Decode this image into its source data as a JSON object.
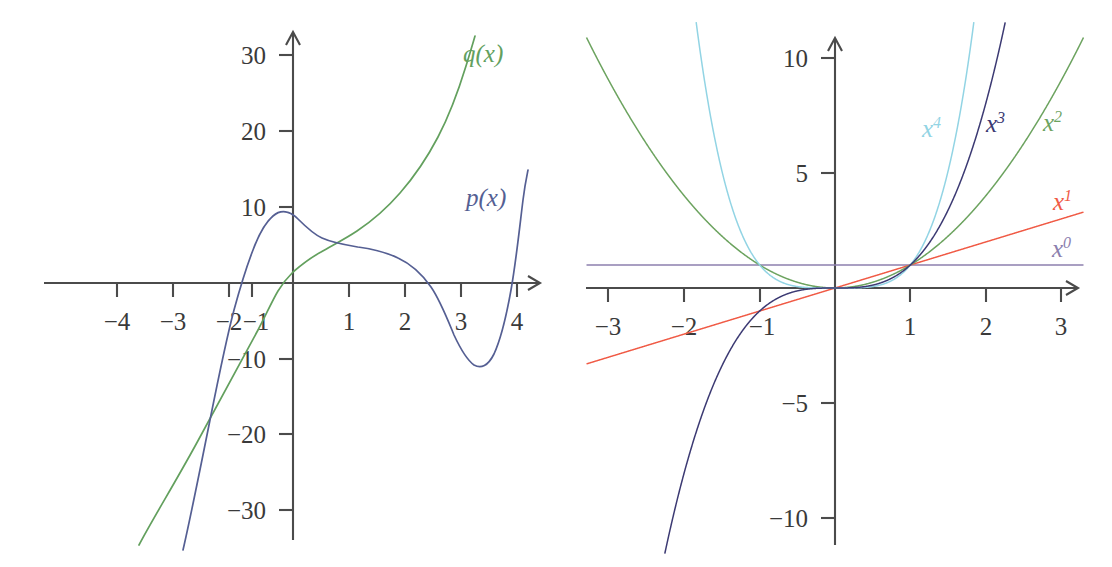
{
  "figures": [
    {
      "name": "left-plot",
      "axes": {
        "x_ticks": [
          "−4",
          "−3",
          "−2",
          "−1",
          "1",
          "2",
          "3",
          "4"
        ],
        "x_tick_values": [
          -4,
          -3,
          -2,
          -1,
          1,
          2,
          3,
          4
        ],
        "y_ticks": [
          "30",
          "20",
          "10",
          "−10",
          "−20",
          "−30"
        ],
        "y_tick_values": [
          30,
          20,
          10,
          -10,
          -20,
          -30
        ],
        "xlim": [
          -4.6,
          4.4
        ],
        "ylim": [
          -33,
          33
        ],
        "arrow_x": true,
        "arrow_y": true
      },
      "labels": [
        {
          "name": "q-label",
          "text": "q(x)",
          "color": "#63a05e",
          "x": 463,
          "y": 62
        },
        {
          "name": "p-label",
          "text": "p(x)",
          "color": "#555f93",
          "x": 466,
          "y": 206
        }
      ]
    },
    {
      "name": "right-plot",
      "axes": {
        "x_ticks": [
          "−3",
          "−2",
          "−1",
          "1",
          "2",
          "3"
        ],
        "x_tick_values": [
          -3,
          -2,
          -1,
          1,
          2,
          3
        ],
        "y_ticks": [
          "10",
          "5",
          "−5",
          "−10"
        ],
        "y_tick_values": [
          10,
          5,
          -5,
          -10
        ],
        "xlim": [
          -3.4,
          3.4
        ],
        "ylim": [
          -11.5,
          11.5
        ],
        "arrow_x": true,
        "arrow_y": true
      },
      "labels": [
        {
          "name": "x4-label",
          "base": "x",
          "exponent": "4",
          "color": "#92d4e4",
          "x": 922,
          "y": 137
        },
        {
          "name": "x3-label",
          "base": "x",
          "exponent": "3",
          "color": "#3c3a73",
          "x": 986,
          "y": 132
        },
        {
          "name": "x2-label",
          "base": "x",
          "exponent": "2",
          "color": "#6ca35f",
          "x": 1043,
          "y": 131
        },
        {
          "name": "x1-label",
          "base": "x",
          "exponent": "1",
          "color": "#f05a45",
          "x": 1053,
          "y": 210
        },
        {
          "name": "x0-label",
          "base": "x",
          "exponent": "0",
          "color": "#8c7fae",
          "x": 1052,
          "y": 257
        }
      ]
    }
  ],
  "chart_data": [
    {
      "type": "line",
      "name": "left-plot",
      "title": "",
      "xlabel": "",
      "ylabel": "",
      "xlim": [
        -4.6,
        4.4
      ],
      "ylim": [
        -33,
        33
      ],
      "grid": false,
      "legend": "inline-curve-labels",
      "xticks": [
        -4,
        -3,
        -2,
        -1,
        1,
        2,
        3,
        4
      ],
      "yticks": [
        30,
        20,
        10,
        -10,
        -20,
        -30
      ],
      "series": [
        {
          "name": "p(x)",
          "color": "#555f93",
          "note": "degree-4 polynomial; roots near x = -1.15, 2, 3.85; local max +8 at x = -0.6; saddle-like shoulder near x = 1; local min -11 at x = 3.15",
          "x": [
            -1.95,
            -1.8,
            -1.6,
            -1.4,
            -1.2,
            -1.0,
            -0.8,
            -0.6,
            -0.4,
            -0.2,
            0.0,
            0.4,
            0.8,
            1.2,
            1.6,
            2.0,
            2.4,
            2.8,
            3.2,
            3.6,
            3.9,
            4.05
          ],
          "y": [
            -33.0,
            -27.5,
            -20.0,
            -12.5,
            -5.0,
            1.5,
            6.2,
            8.0,
            7.6,
            6.6,
            5.7,
            4.9,
            4.5,
            4.2,
            3.3,
            0.0,
            -5.4,
            -9.8,
            -11.0,
            -6.0,
            2.0,
            9.5
          ]
        },
        {
          "name": "q(x)",
          "color": "#63a05e",
          "note": "degree-3 polynomial; root near x = -1.25; q(0) ≈ 4; rises steeply to ≈ 32 near x = 3.1",
          "x": [
            -2.75,
            -2.5,
            -2.25,
            -2.0,
            -1.75,
            -1.5,
            -1.25,
            -1.0,
            -0.5,
            0.0,
            0.5,
            1.0,
            1.5,
            2.0,
            2.5,
            3.0,
            3.15
          ],
          "y": [
            -33.0,
            -26.5,
            -20.0,
            -14.5,
            -10.0,
            -6.0,
            0.0,
            1.6,
            3.0,
            4.1,
            5.3,
            7.2,
            10.6,
            15.6,
            22.5,
            31.0,
            33.5
          ]
        }
      ]
    },
    {
      "type": "line",
      "name": "right-plot",
      "title": "",
      "xlabel": "",
      "ylabel": "",
      "xlim": [
        -3.4,
        3.4
      ],
      "ylim": [
        -11.5,
        11.5
      ],
      "grid": false,
      "legend": "inline-curve-labels",
      "xticks": [
        -3,
        -2,
        -1,
        1,
        2,
        3
      ],
      "yticks": [
        10,
        5,
        -5,
        -10
      ],
      "series": [
        {
          "name": "x^0",
          "color": "#8c7fae",
          "formula": "y = 1",
          "note": "constant horizontal line at y = 1"
        },
        {
          "name": "x^1",
          "color": "#f05a45",
          "formula": "y = x",
          "note": "straight line through the origin with slope 1"
        },
        {
          "name": "x^2",
          "color": "#6ca35f",
          "formula": "y = x^2",
          "note": "upward parabola, passes (±1, 1)"
        },
        {
          "name": "x^3",
          "color": "#3c3a73",
          "formula": "y = x^3",
          "note": "odd cubic, passes (1, 1) and (-1, -1)"
        },
        {
          "name": "x^4",
          "color": "#92d4e4",
          "formula": "y = x^4",
          "note": "even quartic, passes (±1, 1), steeper than x^2"
        }
      ]
    }
  ]
}
